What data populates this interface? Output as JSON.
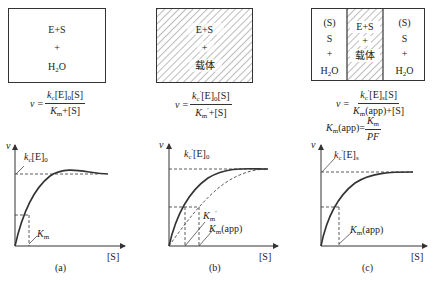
{
  "panels": [
    {
      "id": "a",
      "box": {
        "lines": [
          "E+S",
          "+",
          "H₂O"
        ],
        "hatched": false
      },
      "equation": {
        "lhs": "v=",
        "numerator": "k_c[E]_0[S]",
        "denominator": "K_m+[S]"
      },
      "graph": {
        "y_axis": "v",
        "x_axis": "[S]",
        "plateau_label": "k_c[E]_0",
        "half_label": "K_m"
      },
      "caption": "(a)"
    },
    {
      "id": "b",
      "box": {
        "lines": [
          "E+S",
          "+",
          "载体"
        ],
        "hatched": true
      },
      "equation": {
        "lhs": "v=",
        "numerator": "k'_c[E]_0[S]",
        "denominator": "K'_m+[S]"
      },
      "graph": {
        "y_axis": "v",
        "x_axis": "[S]",
        "plateau_label": "k'_c[E]_0",
        "half_labels": [
          "K'_m",
          "K_m(app)"
        ]
      },
      "caption": "(b)"
    },
    {
      "id": "c",
      "box": {
        "left": [
          "(S)",
          "S",
          "+",
          "H₂O"
        ],
        "middle": [
          "E+S",
          "+",
          "载体"
        ],
        "right": [
          "(S)",
          "S",
          "+",
          "H₂O"
        ],
        "middle_hatched": true
      },
      "equation": {
        "lhs": "v=",
        "numerator": "k'_c[E]_s[S]",
        "denominator": "K_m(app)+[S]"
      },
      "equation2": {
        "lhs": "K_m(app)=",
        "numerator": "K_m",
        "denominator": "PF"
      },
      "graph": {
        "y_axis": "v",
        "x_axis": "[S]",
        "plateau_label": "k'_c[E]_s",
        "half_label": "K_m(app)"
      },
      "caption": "(c)"
    }
  ],
  "text": {
    "a_box1": "E+S",
    "a_box2": "+",
    "a_box3_pre": "H",
    "a_box3_sub": "2",
    "a_box3_post": "O",
    "b_box1": "E+S",
    "b_box2": "+",
    "b_box3": "载体",
    "c_l1": "(S)",
    "c_l2": "S",
    "c_l3": "+",
    "c_l4_pre": "H",
    "c_l4_sub": "2",
    "c_l4_post": "O",
    "c_m1": "E+S",
    "c_m2": "+",
    "c_m3": "载体",
    "c_r1": "(S)",
    "c_r2": "S",
    "c_r3": "+",
    "c_r4_pre": "H",
    "c_r4_sub": "2",
    "c_r4_post": "O",
    "v": "v",
    "eq": "=",
    "S_axis": "[S]",
    "cap_a": "(a)",
    "cap_b": "(b)",
    "cap_c": "(c)"
  }
}
